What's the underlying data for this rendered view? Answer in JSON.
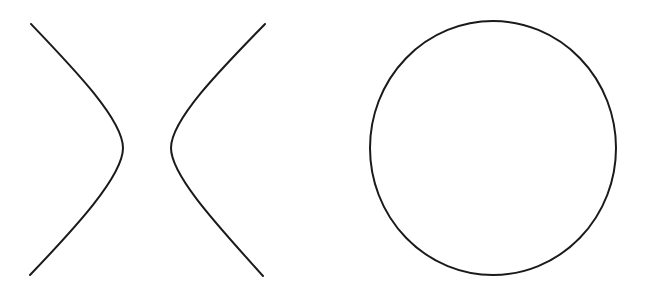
{
  "figure": {
    "background": "#ffffff",
    "stroke_color": "#1a1a1a",
    "stroke_width": 2,
    "shapes": [
      {
        "name": "hyperbola",
        "branches": [
          {
            "side": "left",
            "path": "M31,24 C75,70 123,120 123,148 C123,176 75,228 30,275"
          },
          {
            "side": "right",
            "path": "M265,24 C220,70 171,120 171,148 C171,176 220,228 263,276"
          }
        ]
      },
      {
        "name": "circle",
        "cx": 493,
        "cy": 148,
        "rx": 123,
        "ry": 127
      }
    ]
  }
}
